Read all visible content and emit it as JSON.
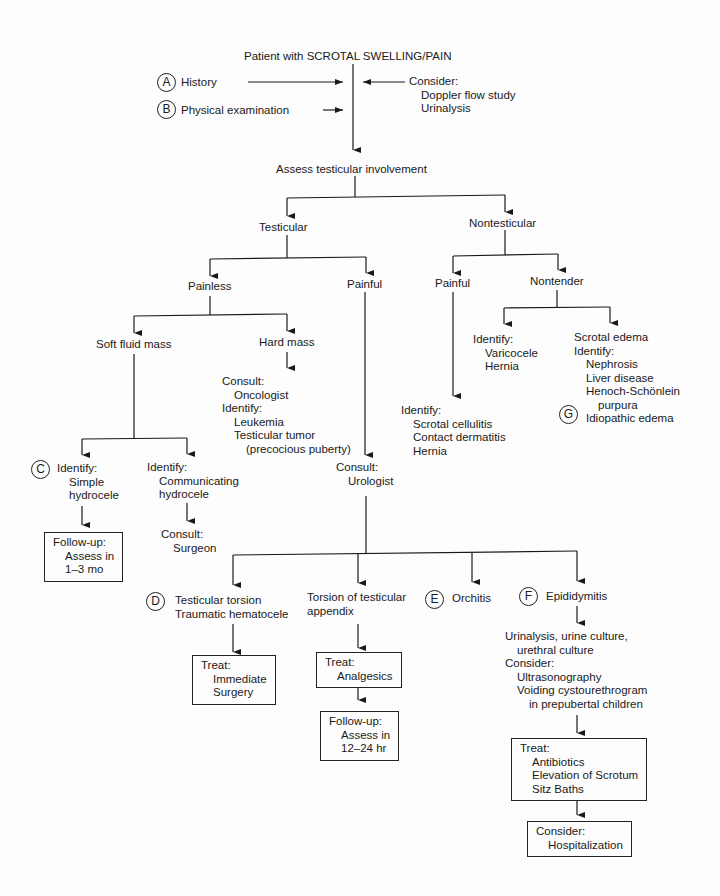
{
  "title": "Patient with SCROTAL SWELLING/PAIN",
  "steps": {
    "A": {
      "badge": "A",
      "label": "History"
    },
    "B": {
      "badge": "B",
      "label": "Physical examination"
    }
  },
  "consider_top": {
    "heading": "Consider:",
    "items": [
      "Doppler flow study",
      "Urinalysis"
    ]
  },
  "assess": "Assess testicular involvement",
  "testicular": {
    "label": "Testicular",
    "painless": {
      "label": "Painless",
      "soft_fluid_mass": {
        "label": "Soft fluid mass",
        "simple": {
          "badge": "C",
          "heading": "Identify:",
          "items": [
            "Simple",
            "hydrocele"
          ],
          "followup": {
            "heading": "Follow-up:",
            "items": [
              "Assess in",
              "1–3 mo"
            ]
          }
        },
        "communicating": {
          "heading": "Identify:",
          "items": [
            "Communicating",
            "hydrocele"
          ],
          "consult": {
            "heading": "Consult:",
            "items": [
              "Surgeon"
            ]
          }
        }
      },
      "hard_mass": {
        "label": "Hard mass",
        "consult_heading": "Consult:",
        "consult_items": [
          "Oncologist"
        ],
        "identify_heading": "Identify:",
        "identify_items": [
          "Leukemia",
          "Testicular tumor"
        ],
        "note": "(precocious puberty)"
      }
    },
    "painful": {
      "label": "Painful",
      "consult": {
        "heading": "Consult:",
        "items": [
          "Urologist"
        ]
      },
      "outcomes": {
        "torsion": {
          "badge": "D",
          "items": [
            "Testicular torsion",
            "Traumatic hematocele"
          ],
          "treat": {
            "heading": "Treat:",
            "items": [
              "Immediate",
              "Surgery"
            ]
          }
        },
        "appendix": {
          "items": [
            "Torsion of testicular",
            "appendix"
          ],
          "treat": {
            "heading": "Treat:",
            "items": [
              "Analgesics"
            ]
          },
          "followup": {
            "heading": "Follow-up:",
            "items": [
              "Assess in",
              "12–24 hr"
            ]
          }
        },
        "orchitis": {
          "badge": "E",
          "label": "Orchitis"
        },
        "epididymitis": {
          "badge": "F",
          "label": "Epididymitis",
          "workup": [
            "Urinalysis, urine culture,",
            "urethral culture"
          ],
          "consider_heading": "Consider:",
          "consider_items": [
            "Ultrasonography",
            "Voiding cystourethrogram"
          ],
          "consider_note": "in prepubertal children",
          "treat": {
            "heading": "Treat:",
            "items": [
              "Antibiotics",
              "Elevation of Scrotum",
              "Sitz Baths"
            ]
          },
          "consider2": {
            "heading": "Consider:",
            "items": [
              "Hospitalization"
            ]
          }
        }
      }
    }
  },
  "nontesticular": {
    "label": "Nontesticular",
    "painful": {
      "label": "Painful",
      "heading": "Identify:",
      "items": [
        "Scrotal cellulitis",
        "Contact dermatitis",
        "Hernia"
      ]
    },
    "nontender": {
      "label": "Nontender",
      "left": {
        "heading": "Identify:",
        "items": [
          "Varicocele",
          "Hernia"
        ]
      },
      "right": {
        "line1": "Scrotal edema",
        "heading": "Identify:",
        "items": [
          "Nephrosis",
          "Liver disease",
          "Henoch-Schönlein"
        ],
        "cont": "purpura",
        "badge": "G",
        "last": "Idiopathic edema"
      }
    }
  },
  "colors": {
    "ink": "#1a1a1a",
    "paper": "#fdfdfd"
  }
}
